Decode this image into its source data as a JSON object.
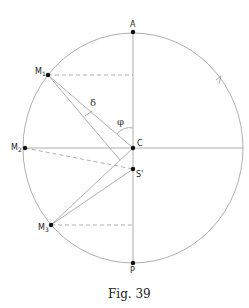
{
  "figure": {
    "caption": "Fig. 39",
    "colors": {
      "line": "#9a9a9a",
      "point": "#111111",
      "text": "#222222"
    }
  },
  "points": {
    "A": {
      "label": "A",
      "x": 133,
      "y": 32
    },
    "C": {
      "label": "C",
      "x": 133,
      "y": 148
    },
    "P": {
      "label": "P",
      "x": 133,
      "y": 263
    },
    "S": {
      "label": "S'",
      "x": 133,
      "y": 169
    },
    "M1": {
      "label": "M",
      "sub": "1",
      "x": 48,
      "y": 75
    },
    "M2": {
      "label": "M",
      "sub": "2",
      "x": 25,
      "y": 148
    },
    "M3": {
      "label": "M",
      "sub": "3",
      "x": 51,
      "y": 225
    }
  },
  "angles": {
    "delta": "δ",
    "phi": "φ"
  }
}
